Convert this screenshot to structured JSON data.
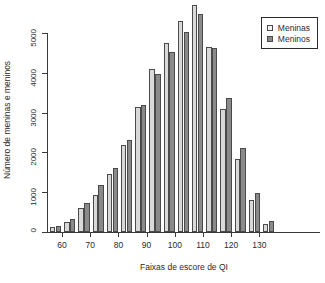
{
  "chart_data": {
    "type": "bar",
    "title": "",
    "xlabel": "Faixas de escore de QI",
    "ylabel": "Número de meninas e meninos",
    "categories": [
      60,
      65,
      70,
      75,
      80,
      85,
      90,
      95,
      100,
      105,
      110,
      115,
      120,
      125,
      130,
      135
    ],
    "xticks": [
      60,
      70,
      80,
      90,
      100,
      110,
      120,
      130
    ],
    "yticks": [
      0,
      1000,
      2000,
      3000,
      4000,
      5000
    ],
    "ylim": [
      0,
      5500
    ],
    "grid": false,
    "legend_position": "top-right",
    "series": [
      {
        "name": "Meninas",
        "color": "#d9d9d9",
        "values": [
          130,
          240,
          610,
          930,
          1450,
          2180,
          3130,
          4100,
          4750,
          5300,
          5700,
          4640,
          3100,
          1830,
          800,
          210
        ]
      },
      {
        "name": "Meninos",
        "color": "#8a8a8a",
        "values": [
          160,
          320,
          730,
          1190,
          1620,
          2300,
          3180,
          3970,
          4530,
          5030,
          5480,
          4620,
          3370,
          2100,
          970,
          270
        ]
      }
    ]
  },
  "legend": {
    "items": [
      {
        "label": "Meninas",
        "swatch": "girls"
      },
      {
        "label": "Meninos",
        "swatch": "boys"
      }
    ]
  }
}
